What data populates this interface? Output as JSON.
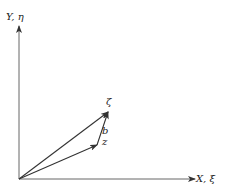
{
  "diagram": {
    "axes": {
      "y_label": "Y, η",
      "x_label": "X, ξ"
    },
    "vectors": [
      {
        "name": "ζ",
        "from": "origin",
        "to": "zeta-tip"
      },
      {
        "name": "z",
        "from": "origin",
        "to": "z-tip"
      },
      {
        "name": "b",
        "from": "z-tip",
        "to": "zeta-tip"
      }
    ],
    "labels": {
      "zeta": "ζ",
      "z": "z",
      "b": "b"
    },
    "colors": {
      "line": "#333333",
      "background": "#ffffff"
    }
  }
}
